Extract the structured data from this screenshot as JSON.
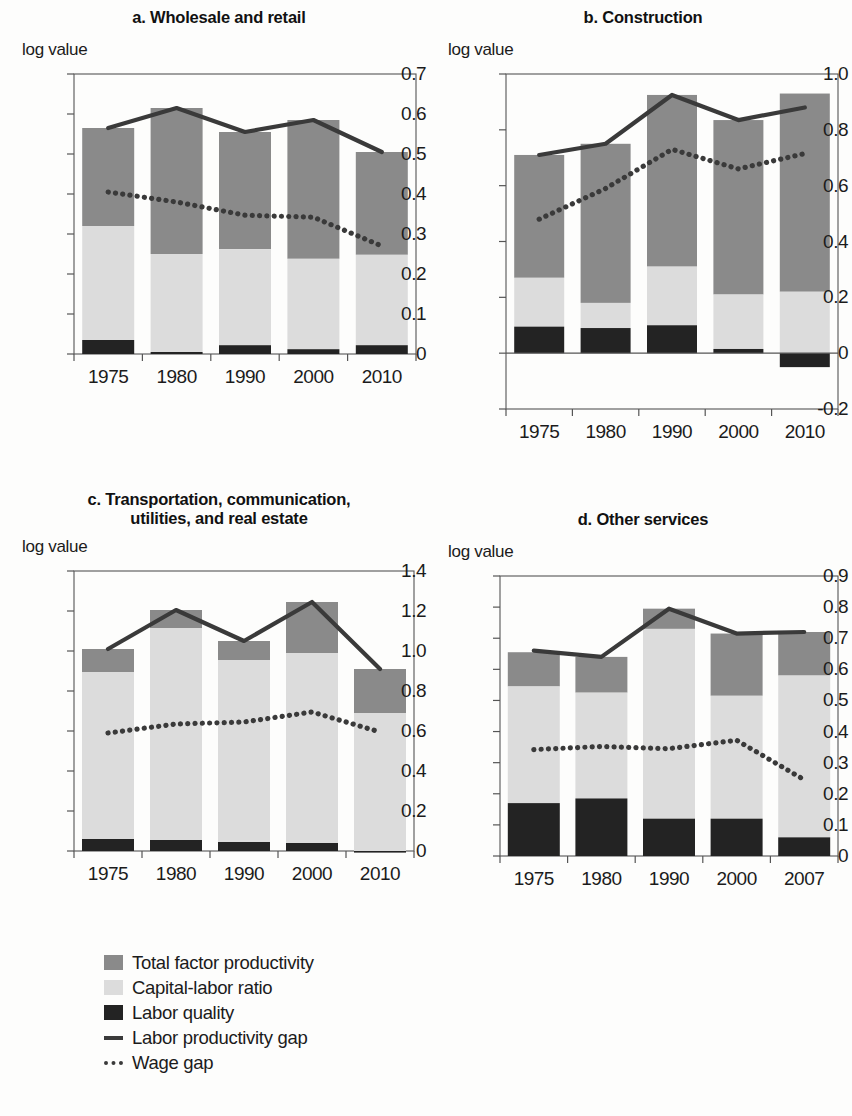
{
  "figure": {
    "axis_label": "log value",
    "colors": {
      "tfp": "#8a8a8a",
      "capital_labor": "#dcdcdc",
      "labor_quality": "#232323",
      "labor_productivity_gap": "#3a3a3a",
      "wage_gap": "#3a3a3a",
      "axis": "#555555"
    }
  },
  "legend": {
    "items": [
      {
        "label": "Total factor productivity",
        "marker": "square-dark-gray"
      },
      {
        "label": "Capital-labor ratio",
        "marker": "square-light-gray"
      },
      {
        "label": "Labor quality",
        "marker": "square-black"
      },
      {
        "label": "Labor productivity gap",
        "marker": "solid-line"
      },
      {
        "label": "Wage gap",
        "marker": "dotted-line"
      }
    ]
  },
  "chart_data": [
    {
      "id": "panel-a",
      "type": "bar",
      "title": "a. Wholesale and retail",
      "xlabel": "",
      "ylabel": "log value",
      "ylim": [
        0,
        0.7
      ],
      "yticks": [
        0,
        0.1,
        0.2,
        0.3,
        0.4,
        0.5,
        0.6,
        0.7
      ],
      "ytick_labels": [
        "0",
        "0.1",
        "0.2",
        "0.3",
        "0.4",
        "0.5",
        "0.6",
        "0.7"
      ],
      "categories": [
        "1975",
        "1980",
        "1990",
        "2000",
        "2010"
      ],
      "stacked": true,
      "series": [
        {
          "name": "Labor quality",
          "values": [
            0.035,
            0.005,
            0.022,
            0.012,
            0.022
          ]
        },
        {
          "name": "Capital-labor ratio",
          "values": [
            0.285,
            0.245,
            0.24,
            0.226,
            0.226
          ]
        },
        {
          "name": "Total factor productivity",
          "values": [
            0.245,
            0.365,
            0.293,
            0.347,
            0.257
          ]
        }
      ],
      "stack_tops": {
        "labor_quality": [
          0.035,
          0.005,
          0.022,
          0.012,
          0.022
        ],
        "capital_labor": [
          0.32,
          0.25,
          0.262,
          0.238,
          0.248
        ],
        "total": [
          0.565,
          0.615,
          0.555,
          0.585,
          0.505
        ]
      },
      "lines": [
        {
          "name": "Labor productivity gap",
          "style": "solid",
          "values": [
            0.565,
            0.615,
            0.555,
            0.585,
            0.505
          ]
        },
        {
          "name": "Wage gap",
          "style": "dotted",
          "values": [
            0.405,
            0.38,
            0.347,
            0.342,
            0.27
          ]
        }
      ],
      "grid": false
    },
    {
      "id": "panel-b",
      "type": "bar",
      "title": "b. Construction",
      "xlabel": "",
      "ylabel": "log value",
      "ylim": [
        -0.2,
        1.0
      ],
      "yticks": [
        -0.2,
        0,
        0.2,
        0.4,
        0.6,
        0.8,
        1.0
      ],
      "ytick_labels": [
        "-0.2",
        "0",
        "0.2",
        "0.4",
        "0.6",
        "0.8",
        "1.0"
      ],
      "categories": [
        "1975",
        "1980",
        "1990",
        "2000",
        "2010"
      ],
      "stacked": true,
      "series": [
        {
          "name": "Labor quality",
          "values": [
            0.095,
            0.09,
            0.1,
            0.015,
            -0.05
          ]
        },
        {
          "name": "Capital-labor ratio",
          "values": [
            0.175,
            0.09,
            0.21,
            0.195,
            0.22
          ]
        },
        {
          "name": "Total factor productivity",
          "values": [
            0.44,
            0.57,
            0.615,
            0.625,
            0.71
          ]
        }
      ],
      "stack_tops": {
        "labor_quality": [
          0.095,
          0.09,
          0.1,
          0.015,
          -0.05
        ],
        "capital_labor": [
          0.27,
          0.18,
          0.31,
          0.21,
          0.22
        ],
        "total": [
          0.71,
          0.75,
          0.925,
          0.835,
          0.93
        ]
      },
      "lines": [
        {
          "name": "Labor productivity gap",
          "style": "solid",
          "values": [
            0.71,
            0.75,
            0.925,
            0.835,
            0.88
          ]
        },
        {
          "name": "Wage gap",
          "style": "dotted",
          "values": [
            0.48,
            0.59,
            0.73,
            0.66,
            0.715
          ]
        }
      ],
      "grid": false
    },
    {
      "id": "panel-c",
      "type": "bar",
      "title": "c. Transportation, communication,\nutilities, and real estate",
      "title_line1": "c. Transportation, communication,",
      "title_line2": "utilities, and real estate",
      "xlabel": "",
      "ylabel": "log value",
      "ylim": [
        0,
        1.4
      ],
      "yticks": [
        0,
        0.2,
        0.4,
        0.6,
        0.8,
        1.0,
        1.2,
        1.4
      ],
      "ytick_labels": [
        "0",
        "0.2",
        "0.4",
        "0.6",
        "0.8",
        "1.0",
        "1.2",
        "1.4"
      ],
      "categories": [
        "1975",
        "1980",
        "1990",
        "2000",
        "2010"
      ],
      "stacked": true,
      "series": [
        {
          "name": "Labor quality",
          "values": [
            0.06,
            0.055,
            0.045,
            0.04,
            -0.008
          ]
        },
        {
          "name": "Capital-labor ratio",
          "values": [
            0.835,
            1.06,
            0.91,
            0.95,
            0.698
          ]
        },
        {
          "name": "Total factor productivity",
          "values": [
            0.115,
            0.09,
            0.095,
            0.255,
            0.22
          ]
        }
      ],
      "stack_tops": {
        "labor_quality": [
          0.06,
          0.055,
          0.045,
          0.04,
          -0.008
        ],
        "capital_labor": [
          0.895,
          1.115,
          0.955,
          0.99,
          0.69
        ],
        "total": [
          1.01,
          1.205,
          1.05,
          1.245,
          0.91
        ]
      },
      "lines": [
        {
          "name": "Labor productivity gap",
          "style": "solid",
          "values": [
            1.01,
            1.205,
            1.05,
            1.245,
            0.91
          ]
        },
        {
          "name": "Wage gap",
          "style": "dotted",
          "values": [
            0.59,
            0.635,
            0.645,
            0.695,
            0.595
          ]
        }
      ],
      "grid": false
    },
    {
      "id": "panel-d",
      "type": "bar",
      "title": "d. Other services",
      "xlabel": "",
      "ylabel": "log value",
      "ylim": [
        0,
        0.9
      ],
      "yticks": [
        0,
        0.1,
        0.2,
        0.3,
        0.4,
        0.5,
        0.6,
        0.7,
        0.8,
        0.9
      ],
      "ytick_labels": [
        "0",
        "0.1",
        "0.2",
        "0.3",
        "0.4",
        "0.5",
        "0.6",
        "0.7",
        "0.8",
        "0.9"
      ],
      "categories": [
        "1975",
        "1980",
        "1990",
        "2000",
        "2007"
      ],
      "stacked": true,
      "series": [
        {
          "name": "Labor quality",
          "values": [
            0.17,
            0.185,
            0.12,
            0.12,
            0.06
          ]
        },
        {
          "name": "Capital-labor ratio",
          "values": [
            0.375,
            0.34,
            0.61,
            0.395,
            0.52
          ]
        },
        {
          "name": "Total factor productivity",
          "values": [
            0.11,
            0.115,
            0.065,
            0.2,
            0.14
          ]
        }
      ],
      "stack_tops": {
        "labor_quality": [
          0.17,
          0.185,
          0.12,
          0.12,
          0.06
        ],
        "capital_labor": [
          0.545,
          0.525,
          0.73,
          0.515,
          0.58
        ],
        "total": [
          0.655,
          0.64,
          0.795,
          0.715,
          0.72
        ]
      },
      "lines": [
        {
          "name": "Labor productivity gap",
          "style": "solid",
          "values": [
            0.66,
            0.64,
            0.795,
            0.715,
            0.72
          ]
        },
        {
          "name": "Wage gap",
          "style": "dotted",
          "values": [
            0.342,
            0.352,
            0.345,
            0.372,
            0.245
          ]
        }
      ],
      "grid": false
    }
  ]
}
